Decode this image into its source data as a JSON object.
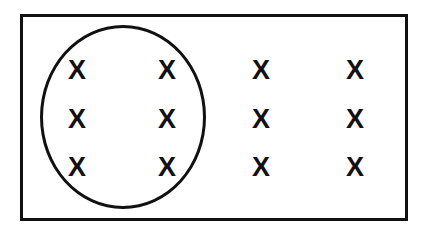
{
  "diagram": {
    "type": "venn-subset",
    "background_color": "#ffffff",
    "stroke_color": "#111111",
    "universe": {
      "shape": "rectangle",
      "label": "",
      "x": 20,
      "y": 14,
      "width": 388,
      "height": 207,
      "stroke_width": 3,
      "fill": "#ffffff"
    },
    "subset": {
      "shape": "ellipse",
      "label": "",
      "center_x": 123,
      "center_y": 117,
      "radius_x": 83,
      "radius_y": 92,
      "stroke_width": 3,
      "fill": "none"
    },
    "element_symbol": "X",
    "rows": 3,
    "columns": 4,
    "total_elements": 12,
    "elements_inside_subset": 6,
    "elements_outside_subset": 6,
    "column_centers": [
      77,
      167,
      261,
      355
    ],
    "row_centers": [
      70,
      119,
      167
    ],
    "elements": [
      {
        "symbol": "X",
        "row": 1,
        "col": 1,
        "x": 77,
        "y": 70,
        "inside": true
      },
      {
        "symbol": "X",
        "row": 1,
        "col": 2,
        "x": 167,
        "y": 70,
        "inside": true
      },
      {
        "symbol": "X",
        "row": 1,
        "col": 3,
        "x": 261,
        "y": 70,
        "inside": false
      },
      {
        "symbol": "X",
        "row": 1,
        "col": 4,
        "x": 355,
        "y": 70,
        "inside": false
      },
      {
        "symbol": "X",
        "row": 2,
        "col": 1,
        "x": 77,
        "y": 119,
        "inside": true
      },
      {
        "symbol": "X",
        "row": 2,
        "col": 2,
        "x": 167,
        "y": 119,
        "inside": true
      },
      {
        "symbol": "X",
        "row": 2,
        "col": 3,
        "x": 261,
        "y": 119,
        "inside": false
      },
      {
        "symbol": "X",
        "row": 2,
        "col": 4,
        "x": 355,
        "y": 119,
        "inside": false
      },
      {
        "symbol": "X",
        "row": 3,
        "col": 1,
        "x": 77,
        "y": 167,
        "inside": true
      },
      {
        "symbol": "X",
        "row": 3,
        "col": 2,
        "x": 167,
        "y": 167,
        "inside": true
      },
      {
        "symbol": "X",
        "row": 3,
        "col": 3,
        "x": 261,
        "y": 167,
        "inside": false
      },
      {
        "symbol": "X",
        "row": 3,
        "col": 4,
        "x": 355,
        "y": 167,
        "inside": false
      }
    ]
  }
}
